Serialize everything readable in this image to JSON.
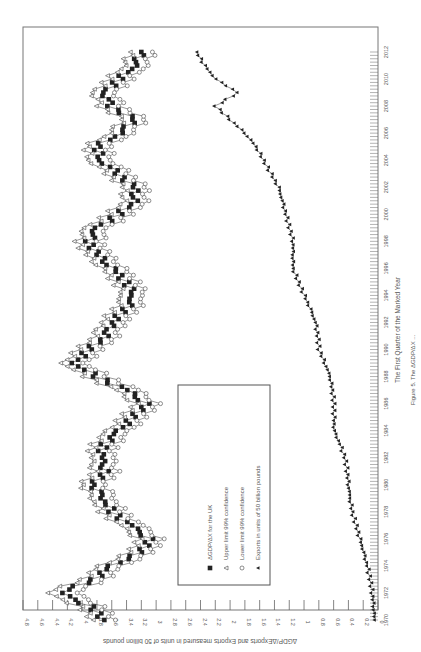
{
  "chart_data": {
    "type": "line",
    "orientation": "rotated-90-clockwise",
    "title": "",
    "xlabel": "The First Quarter of the Marked Year",
    "ylabel": "ΔGDP/ΔExports and Exports measured in units of 50 billion pounds",
    "caption": "Figure 5. The ΔGDP/ΔX ... (caption cut off)",
    "ylim": [
      0,
      4.8
    ],
    "y_ticks": [
      "0",
      "0.2",
      "0.4",
      "0.6",
      "0.8",
      "1",
      "1.2",
      "1.4",
      "1.6",
      "1.8",
      "2",
      "2.2",
      "2.4",
      "2.6",
      "2.8",
      "3",
      "3.2",
      "3.4",
      "3.6",
      "3.8",
      "4",
      "4.2",
      "4.4",
      "4.6",
      "4.8"
    ],
    "x_ticks": [
      "1970",
      "1972",
      "1974",
      "1976",
      "1978",
      "1980",
      "1982",
      "1984",
      "1986",
      "1988",
      "1990",
      "1992",
      "1994",
      "1996",
      "1998",
      "2000",
      "2002",
      "2004",
      "2006",
      "2008",
      "2010",
      "2012"
    ],
    "grid": false,
    "legend_position": "inside, lower-left of rotated plot",
    "x": [
      1970,
      1971,
      1972,
      1973,
      1974,
      1975,
      1976,
      1977,
      1978,
      1979,
      1980,
      1981,
      1982,
      1983,
      1984,
      1985,
      1986,
      1987,
      1988,
      1989,
      1990,
      1991,
      1992,
      1993,
      1994,
      1995,
      1996,
      1997,
      1998,
      1999,
      2000,
      2001,
      2002,
      2003,
      2004,
      2005,
      2006,
      2007,
      2008,
      2009,
      2010,
      2011,
      2012
    ],
    "series": [
      {
        "name": "ΔGDP/ΔX for the UK",
        "marker": "filled-square",
        "values": [
          3.7,
          3.9,
          4.3,
          3.85,
          3.6,
          3.2,
          3.1,
          3.35,
          3.6,
          3.7,
          3.85,
          3.7,
          3.75,
          3.7,
          3.5,
          3.3,
          3.15,
          3.4,
          3.8,
          4.1,
          3.9,
          3.7,
          3.6,
          3.4,
          3.3,
          3.4,
          3.6,
          3.8,
          3.9,
          3.8,
          3.5,
          3.3,
          3.3,
          3.5,
          3.75,
          3.8,
          3.5,
          3.3,
          3.6,
          3.7,
          3.5,
          3.3,
          3.2
        ]
      },
      {
        "name": "Upper limit 99% confidence",
        "marker": "triangle",
        "values": [
          3.85,
          4.05,
          4.5,
          4.0,
          3.75,
          3.35,
          3.25,
          3.5,
          3.75,
          3.85,
          4.0,
          3.85,
          3.9,
          3.85,
          3.65,
          3.45,
          3.3,
          3.55,
          3.95,
          4.25,
          4.05,
          3.85,
          3.75,
          3.55,
          3.45,
          3.55,
          3.75,
          3.95,
          4.05,
          3.95,
          3.65,
          3.45,
          3.45,
          3.65,
          3.9,
          3.95,
          3.65,
          3.45,
          3.75,
          3.85,
          3.65,
          3.45,
          3.35
        ]
      },
      {
        "name": "Lower limit 99% confidence",
        "marker": "open-circle",
        "values": [
          3.55,
          3.75,
          4.1,
          3.7,
          3.45,
          3.05,
          2.95,
          3.2,
          3.45,
          3.55,
          3.7,
          3.55,
          3.6,
          3.55,
          3.35,
          3.15,
          3.0,
          3.25,
          3.65,
          3.95,
          3.75,
          3.55,
          3.45,
          3.25,
          3.15,
          3.25,
          3.45,
          3.65,
          3.75,
          3.65,
          3.35,
          3.15,
          3.15,
          3.35,
          3.6,
          3.65,
          3.35,
          3.15,
          3.45,
          3.55,
          3.35,
          3.15,
          3.05
        ]
      },
      {
        "name": "Exports in units of 50 billion pounds",
        "marker": "filled-triangle",
        "values": [
          0.05,
          0.06,
          0.08,
          0.11,
          0.15,
          0.2,
          0.25,
          0.3,
          0.35,
          0.38,
          0.4,
          0.42,
          0.45,
          0.52,
          0.6,
          0.6,
          0.6,
          0.62,
          0.65,
          0.72,
          0.8,
          0.82,
          0.85,
          0.92,
          1.0,
          1.08,
          1.15,
          1.15,
          1.15,
          1.2,
          1.25,
          1.3,
          1.35,
          1.45,
          1.55,
          1.65,
          1.8,
          2.0,
          2.2,
          1.9,
          2.2,
          2.35,
          2.45
        ]
      }
    ]
  },
  "legend": {
    "items": [
      {
        "label": "ΔGDP/ΔX for the UK",
        "marker": "filled-square"
      },
      {
        "label": "Upper limit 99% confidence",
        "marker": "triangle"
      },
      {
        "label": "Lower limit 99% confidence",
        "marker": "open-circle"
      },
      {
        "label": "Exports in units of 50 billion pounds",
        "marker": "filled-triangle"
      }
    ]
  },
  "axes": {
    "xlabel": "The First Quarter of the Marked Year",
    "ylabel": "ΔGDP/ΔExports and Exports measured in units of 50 billion pounds",
    "caption": "Figure 5. The ΔGDP/ΔX ..."
  },
  "colors": {
    "line": "#333333",
    "marker_fill": "#222222",
    "axis": "#666666",
    "text": "#555555",
    "background": "#ffffff"
  }
}
